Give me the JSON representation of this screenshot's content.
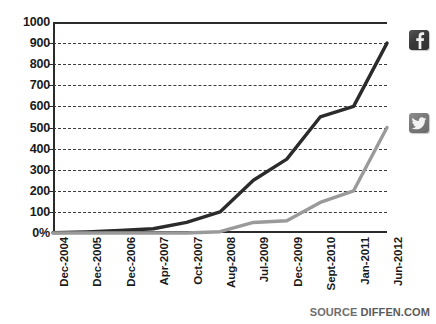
{
  "chart_data": {
    "type": "line",
    "title": "",
    "subtitle": "",
    "xlabel": "",
    "ylabel": "",
    "ylim": [
      0,
      1000
    ],
    "ytick_values": [
      0,
      100,
      200,
      300,
      400,
      500,
      600,
      700,
      800,
      900,
      1000
    ],
    "ytick_labels": [
      "0%",
      "100",
      "200",
      "300",
      "400",
      "500",
      "600",
      "700",
      "800",
      "900",
      "1000"
    ],
    "grid": true,
    "grid_style": "dashed horizontal",
    "legend_position": "right",
    "categories": [
      "Dec-2004",
      "Dec-2005",
      "Dec-2006",
      "Apr-2007",
      "Oct-2007",
      "Aug-2008",
      "Jul-2009",
      "Dec-2009",
      "Sept-2010",
      "Jan-2011",
      "Jun-2012"
    ],
    "series": [
      {
        "name": "Facebook",
        "icon": "facebook-icon",
        "color": "#2b2b2b",
        "values": [
          1,
          5.5,
          12,
          20,
          50,
          100,
          250,
          350,
          550,
          600,
          900
        ]
      },
      {
        "name": "Twitter",
        "icon": "twitter-icon",
        "color": "#9a9a9a",
        "values": [
          0,
          0,
          0,
          0,
          0,
          6,
          50,
          58,
          145,
          200,
          500
        ]
      }
    ],
    "annotations": []
  },
  "legend": {
    "facebook": {
      "icon": "facebook-icon",
      "glyph": "f",
      "label": "Facebook"
    },
    "twitter": {
      "icon": "twitter-icon",
      "glyph": "bird",
      "label": "Twitter"
    }
  },
  "footer": {
    "source_prefix": "SOURCE",
    "source_name": "DIFFEN.COM",
    "source_full": "SOURCE DIFFEN.COM"
  },
  "colors": {
    "facebook_line": "#2b2b2b",
    "twitter_line": "#9a9a9a",
    "axis": "#2b2b2b",
    "grid": "#3b3b3b",
    "background": "#ffffff",
    "source_text": "#5a5a5a"
  }
}
